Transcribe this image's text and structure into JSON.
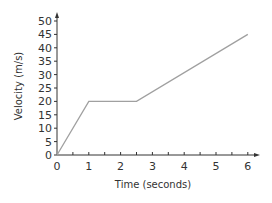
{
  "chart_data": {
    "type": "line",
    "title": "",
    "xlabel": "Time (seconds)",
    "ylabel": "Velocity (m/s)",
    "x": [
      0,
      1,
      2.5,
      6
    ],
    "series": [
      {
        "name": "velocity",
        "values": [
          0,
          20,
          20,
          45
        ],
        "color": "#a0a0a0"
      }
    ],
    "xlim": [
      0,
      6
    ],
    "ylim": [
      0,
      50
    ],
    "xticks": [
      "0",
      "1",
      "2",
      "3",
      "4",
      "5",
      "6"
    ],
    "yticks": [
      "0",
      "5",
      "10",
      "15",
      "20",
      "25",
      "30",
      "35",
      "40",
      "45",
      "50"
    ],
    "grid": false,
    "legend": null
  },
  "colors": {
    "axis": "#333333",
    "line": "#a0a0a0"
  }
}
